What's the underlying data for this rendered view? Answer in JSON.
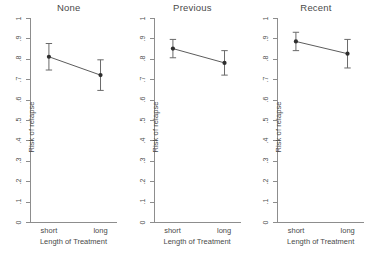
{
  "figure": {
    "xlabel": "Length of Treatment",
    "ylabel": "Risk of relapse",
    "x_categories": [
      "short",
      "long"
    ],
    "y_ticks": [
      "0",
      ".1",
      ".2",
      ".3",
      ".4",
      ".5",
      ".6",
      ".7",
      ".8",
      ".9",
      "1"
    ],
    "panel_titles": [
      "None",
      "Previous",
      "Recent"
    ]
  },
  "chart_data": {
    "type": "line",
    "title": "",
    "subtitle": "",
    "xlabel": "Length of Treatment",
    "ylabel": "Risk of relapse",
    "categories": [
      "short",
      "long"
    ],
    "ylim": [
      0,
      1
    ],
    "xlim": [
      0,
      1
    ],
    "ytick_values": [
      0,
      0.1,
      0.2,
      0.3,
      0.4,
      0.5,
      0.6,
      0.7,
      0.8,
      0.9,
      1
    ],
    "ytick_labels": [
      "0",
      ".1",
      ".2",
      ".3",
      ".4",
      ".5",
      ".6",
      ".7",
      ".8",
      ".9",
      "1"
    ],
    "grid": false,
    "legend": "none",
    "error_bars": "capped confidence intervals",
    "marker": "filled circle",
    "panels": [
      {
        "title": "None",
        "values": [
          0.81,
          0.72
        ],
        "ci_low": [
          0.745,
          0.645
        ],
        "ci_high": [
          0.875,
          0.795
        ]
      },
      {
        "title": "Previous",
        "values": [
          0.85,
          0.78
        ],
        "ci_low": [
          0.805,
          0.72
        ],
        "ci_high": [
          0.895,
          0.84
        ]
      },
      {
        "title": "Recent",
        "values": [
          0.885,
          0.825
        ],
        "ci_low": [
          0.84,
          0.755
        ],
        "ci_high": [
          0.93,
          0.895
        ]
      }
    ]
  }
}
